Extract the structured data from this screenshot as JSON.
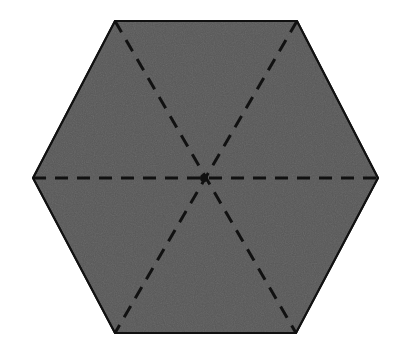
{
  "figure": {
    "shape_name": "hexagon",
    "background_color": "#ffffff",
    "width": 395,
    "height": 338
  },
  "polygon": {
    "name": "regular-hexagon",
    "sides": 6,
    "fill_color": "#585858",
    "stroke_color": "#111111",
    "stroke_width": 2,
    "points": "115,21 297,21 378,178 296,333 115,333 33,178",
    "vertices": [
      {
        "label": "top-left",
        "x": 115,
        "y": 21
      },
      {
        "label": "top-right",
        "x": 297,
        "y": 21
      },
      {
        "label": "right",
        "x": 378,
        "y": 178
      },
      {
        "label": "bottom-right",
        "x": 296,
        "y": 333
      },
      {
        "label": "bottom-left",
        "x": 115,
        "y": 333
      },
      {
        "label": "left",
        "x": 33,
        "y": 178
      }
    ]
  },
  "center": {
    "name": "center-point",
    "x": 204,
    "y": 178,
    "radius": 4,
    "color": "#111111"
  },
  "diagonals": {
    "style": "dashed",
    "stroke_color": "#111111",
    "stroke_width": 3,
    "dash_pattern": "13 9",
    "count": 3,
    "lines": [
      {
        "name": "diagonal-horizontal",
        "from": "left",
        "to": "right",
        "x1": 33,
        "y1": 178,
        "x2": 378,
        "y2": 178
      },
      {
        "name": "diagonal-topleft-bottomright",
        "from": "top-left",
        "to": "bottom-right",
        "x1": 115,
        "y1": 21,
        "x2": 296,
        "y2": 333
      },
      {
        "name": "diagonal-topright-bottomleft",
        "from": "top-right",
        "to": "bottom-left",
        "x1": 297,
        "y1": 21,
        "x2": 115,
        "y2": 333
      }
    ]
  }
}
